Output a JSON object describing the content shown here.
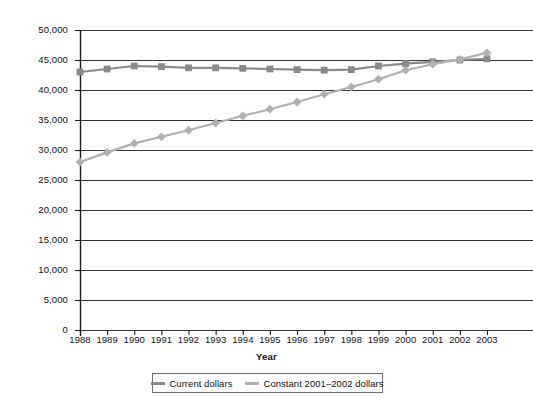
{
  "chart_data": {
    "type": "line",
    "title": "",
    "xlabel": "Year",
    "ylabel": "",
    "categories": [
      "1988",
      "1989",
      "1990",
      "1991",
      "1992",
      "1993",
      "1994",
      "1995",
      "1996",
      "1997",
      "1998",
      "1999",
      "2000",
      "2001",
      "2002",
      "2003"
    ],
    "x": [
      1988,
      1989,
      1990,
      1991,
      1992,
      1993,
      1994,
      1995,
      1996,
      1997,
      1998,
      1999,
      2000,
      2001,
      2002,
      2003
    ],
    "xlim": [
      1988,
      2003
    ],
    "ylim": [
      0,
      50000
    ],
    "y_ticks": [
      0,
      5000,
      10000,
      15000,
      20000,
      25000,
      30000,
      35000,
      40000,
      45000,
      50000
    ],
    "y_tick_labels": [
      "0",
      "5,000",
      "10,000",
      "15,000",
      "20,000",
      "25,000",
      "30,000",
      "35,000",
      "40,000",
      "45,000",
      "50,000"
    ],
    "grid": "horizontal",
    "legend_position": "bottom-center",
    "series": [
      {
        "name": "Current dollars",
        "color": "#8a8a8a",
        "marker": "square",
        "values": [
          43000,
          43500,
          44000,
          43900,
          43700,
          43700,
          43600,
          43500,
          43400,
          43300,
          43400,
          44000,
          44400,
          44700,
          45000,
          45200
        ]
      },
      {
        "name": "Constant 2001–2002 dollars",
        "color": "#b0b0b0",
        "marker": "diamond",
        "values": [
          28000,
          29600,
          31100,
          32200,
          33300,
          34500,
          35700,
          36800,
          38000,
          39300,
          40500,
          41800,
          43300,
          44300,
          45100,
          46200
        ]
      }
    ]
  },
  "axes": {
    "x_title": "Year"
  },
  "legend": {
    "entries": [
      {
        "label": "Current dollars",
        "color": "#8a8a8a"
      },
      {
        "label": "Constant 2001–2002 dollars",
        "color": "#b0b0b0"
      }
    ]
  },
  "colors": {
    "axis": "#1a1a1a",
    "gridline": "#333333",
    "series_current": "#8a8a8a",
    "series_constant": "#b0b0b0",
    "background": "#ffffff"
  }
}
